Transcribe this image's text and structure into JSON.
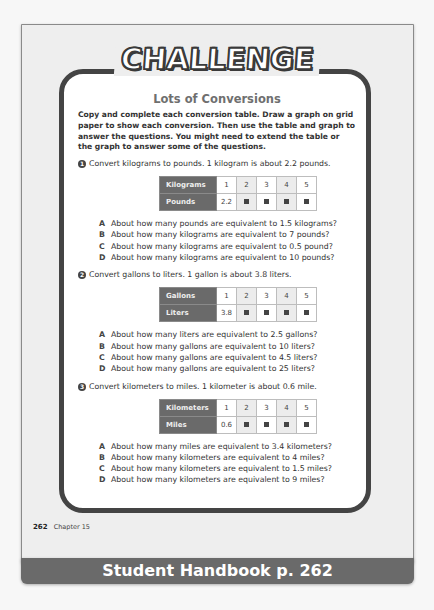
{
  "header": {
    "banner": "CHALLENGE"
  },
  "activity": {
    "title": "Lots of Conversions",
    "intro": "Copy and complete each conversion table. Draw a graph on grid paper to show each conversion. Then use the table and graph to answer the questions. You might need to extend the table or the graph to answer some of the questions."
  },
  "problems": [
    {
      "number": "1",
      "prompt": "Convert kilograms to pounds. 1 kilogram is about 2.2 pounds.",
      "table": {
        "row1_label": "Kilograms",
        "row1": [
          "1",
          "2",
          "3",
          "4",
          "5"
        ],
        "row2_label": "Pounds",
        "row2_first": "2.2"
      },
      "questions": [
        {
          "letter": "A",
          "text": "About how many pounds are equivalent to 1.5 kilograms?"
        },
        {
          "letter": "B",
          "text": "About how many kilograms are equivalent to 7 pounds?"
        },
        {
          "letter": "C",
          "text": "About how many kilograms are equivalent to 0.5 pound?"
        },
        {
          "letter": "D",
          "text": "About how many kilograms are equivalent to 10 pounds?"
        }
      ]
    },
    {
      "number": "2",
      "prompt": "Convert gallons to liters. 1 gallon is about 3.8 liters.",
      "table": {
        "row1_label": "Gallons",
        "row1": [
          "1",
          "2",
          "3",
          "4",
          "5"
        ],
        "row2_label": "Liters",
        "row2_first": "3.8"
      },
      "questions": [
        {
          "letter": "A",
          "text": "About how many liters are equivalent to 2.5 gallons?"
        },
        {
          "letter": "B",
          "text": "About how many gallons are equivalent to 10 liters?"
        },
        {
          "letter": "C",
          "text": "About how many gallons are equivalent to 4.5 liters?"
        },
        {
          "letter": "D",
          "text": "About how many gallons are equivalent to 25 liters?"
        }
      ]
    },
    {
      "number": "3",
      "prompt": "Convert kilometers to miles. 1 kilometer is about 0.6 mile.",
      "table": {
        "row1_label": "Kilometers",
        "row1": [
          "1",
          "2",
          "3",
          "4",
          "5"
        ],
        "row2_label": "Miles",
        "row2_first": "0.6"
      },
      "questions": [
        {
          "letter": "A",
          "text": "About how many miles are equivalent to 3.4 kilometers?"
        },
        {
          "letter": "B",
          "text": "About how many kilometers are equivalent to 4 miles?"
        },
        {
          "letter": "C",
          "text": "About how many kilometers are equivalent to 1.5 miles?"
        },
        {
          "letter": "D",
          "text": "About how many kilometers are equivalent to 9 miles?"
        }
      ]
    }
  ],
  "footer": {
    "page_number": "262",
    "chapter": "Chapter 15"
  },
  "bottom_bar": {
    "label": "Student Handbook p. 262"
  },
  "colors": {
    "dark_gray": "#444444",
    "header_cell": "#6a6a6a",
    "title_gray": "#6f6f6f",
    "page_bg": "#eeeeee"
  }
}
